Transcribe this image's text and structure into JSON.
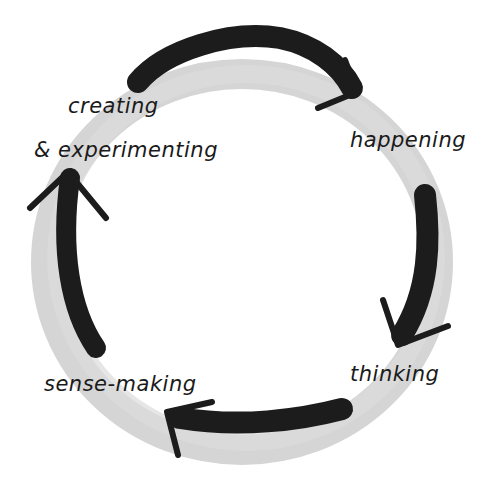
{
  "diagram": {
    "type": "cycle",
    "style": "hand-drawn marker on grey ring",
    "colors": {
      "background": "#ffffff",
      "ring": "#d0d0d0",
      "arrow": "#1c1c1c",
      "text": "#1a1a1a"
    },
    "direction": "clockwise",
    "nodes": [
      {
        "id": "creating",
        "label_line1": "creating",
        "label_line2": "& experimenting",
        "position": "top-left"
      },
      {
        "id": "happening",
        "label": "happening",
        "position": "right"
      },
      {
        "id": "thinking",
        "label": "thinking",
        "position": "bottom-right"
      },
      {
        "id": "sense-making",
        "label": "sense-making",
        "position": "bottom-left"
      }
    ],
    "edges": [
      {
        "from": "creating",
        "to": "happening",
        "location": "top arc"
      },
      {
        "from": "happening",
        "to": "thinking",
        "location": "right arc"
      },
      {
        "from": "thinking",
        "to": "sense-making",
        "location": "bottom arc"
      },
      {
        "from": "sense-making",
        "to": "creating",
        "location": "left arc"
      }
    ]
  }
}
